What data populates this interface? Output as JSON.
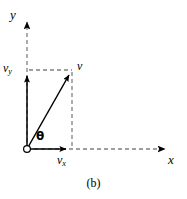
{
  "figure": {
    "caption": "(b)",
    "axes": {
      "y_label": "y",
      "x_label": "x"
    },
    "vectors": {
      "resultant_label": "v",
      "x_component_label": "v",
      "x_component_sub": "x",
      "y_component_label": "v",
      "y_component_sub": "y",
      "angle_label": "θ"
    },
    "colors": {
      "stroke": "#000000",
      "dash": "#808080",
      "background": "#ffffff"
    },
    "geometry": {
      "origin_x": 27,
      "origin_y": 149,
      "tip_x": 72,
      "tip_y": 70,
      "x_axis_end": 172,
      "y_axis_end": 15
    }
  }
}
